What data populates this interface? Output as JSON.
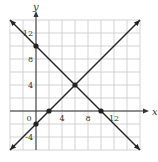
{
  "chart_data": {
    "type": "line",
    "title": "",
    "xlabel": "x",
    "ylabel": "y",
    "xlim": [
      -4,
      16
    ],
    "ylim": [
      -6,
      14
    ],
    "grid": true,
    "grid_step": 2,
    "x_tick_labels": [
      "0",
      "4",
      "8",
      "12"
    ],
    "x_tick_values": [
      0,
      4,
      8,
      12
    ],
    "y_tick_labels": [
      "12",
      "8",
      "4",
      "-4"
    ],
    "y_tick_values": [
      12,
      8,
      4,
      -4
    ],
    "series": [
      {
        "name": "y = -x + 10",
        "slope": -1,
        "intercept": 10,
        "x": [
          -4,
          16
        ],
        "y": [
          14,
          -6
        ]
      },
      {
        "name": "y = x - 2",
        "slope": 1,
        "intercept": -2,
        "x": [
          -4,
          16
        ],
        "y": [
          -6,
          14
        ]
      }
    ],
    "points": [
      {
        "x": 0,
        "y": 10
      },
      {
        "x": 10,
        "y": 0
      },
      {
        "x": 6,
        "y": 4
      },
      {
        "x": 2,
        "y": 0
      },
      {
        "x": 0,
        "y": -2
      }
    ],
    "colors": {
      "line": "#222222",
      "grid": "#c8c8c8",
      "axis": "#333333"
    }
  }
}
